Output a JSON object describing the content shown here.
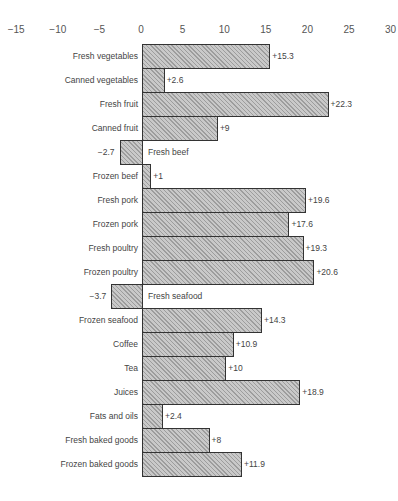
{
  "chart_data": {
    "type": "bar",
    "orientation": "horizontal",
    "title": "",
    "xlabel": "",
    "ylabel": "",
    "xlim": [
      -15,
      30
    ],
    "x_ticks": [
      "−15",
      "−10",
      "−5",
      "0",
      "5",
      "10",
      "15",
      "20",
      "25",
      "30"
    ],
    "x_tick_values": [
      -15,
      -10,
      -5,
      0,
      5,
      10,
      15,
      20,
      25,
      30
    ],
    "grid": false,
    "legend": null,
    "categories": [
      "Fresh vegetables",
      "Canned vegetables",
      "Fresh fruit",
      "Canned fruit",
      "Fresh beef",
      "Frozen beef",
      "Fresh pork",
      "Frozen pork",
      "Fresh poultry",
      "Frozen poultry",
      "Fresh seafood",
      "Frozen seafood",
      "Coffee",
      "Tea",
      "Juices",
      "Fats and oils",
      "Fresh baked goods",
      "Frozen baked goods"
    ],
    "values": [
      15.3,
      2.6,
      22.3,
      9,
      -2.7,
      1,
      19.6,
      17.6,
      19.3,
      20.6,
      -3.7,
      14.3,
      10.9,
      10,
      18.9,
      2.4,
      8,
      11.9
    ],
    "value_labels": [
      "+15.3",
      "+2.6",
      "+22.3",
      "+9",
      "−2.7",
      "+1",
      "+19.6",
      "+17.6",
      "+19.3",
      "+20.6",
      "−3.7",
      "+14.3",
      "+10.9",
      "+10",
      "+18.9",
      "+2.4",
      "+8",
      "+11.9"
    ],
    "colors": {
      "bar_fill": "#c9c9c9",
      "bar_border": "#333333"
    }
  }
}
